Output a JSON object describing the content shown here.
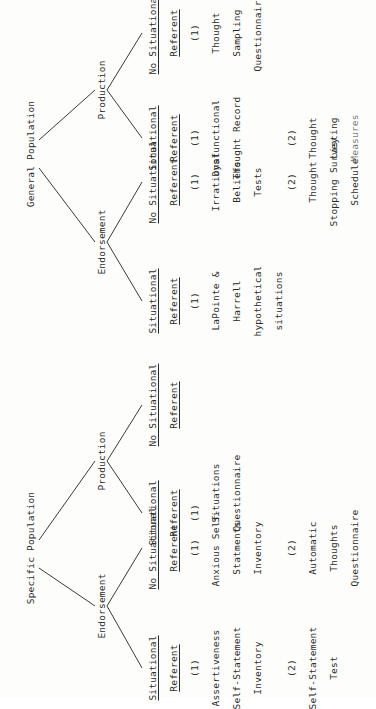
{
  "document": {
    "rotation": "page rotated 90 degrees counter-clockwise",
    "trees": [
      {
        "root": "Specific Population",
        "branches": [
          {
            "label": "Endorsement",
            "columns": [
              {
                "heading_line1": "Situational",
                "heading_line2": "Referent",
                "groups": [
                  {
                    "number": "(1)",
                    "lines": [
                      "Assertiveness",
                      "Self-Statement",
                      "Inventory"
                    ]
                  },
                  {
                    "number": "(2)",
                    "lines": [
                      "Self-Statement",
                      "Test"
                    ]
                  }
                ]
              },
              {
                "heading_line1": "No Situational",
                "heading_line2": "Referent",
                "groups": [
                  {
                    "number": "(1)",
                    "lines": [
                      "Anxious Self-",
                      "Statments",
                      "Inventory"
                    ]
                  },
                  {
                    "number": "(2)",
                    "lines": [
                      "Automatic",
                      "Thoughts",
                      "Questionnaire"
                    ]
                  }
                ]
              }
            ]
          },
          {
            "label": "Production",
            "columns": [
              {
                "heading_line1": "Situational",
                "heading_line2": "Referent",
                "groups": [
                  {
                    "number": "(1)",
                    "lines": [
                      "Situations",
                      "Questionnaire"
                    ]
                  }
                ]
              },
              {
                "heading_line1": "No Situational",
                "heading_line2": "Referent",
                "groups": []
              }
            ]
          }
        ]
      },
      {
        "root": "General Population",
        "branches": [
          {
            "label": "Endorsement",
            "columns": [
              {
                "heading_line1": "Situational",
                "heading_line2": "Referent",
                "groups": [
                  {
                    "number": "(1)",
                    "lines": [
                      "LaPointe &",
                      "Harrell",
                      "hypothetical",
                      "situations"
                    ]
                  }
                ]
              },
              {
                "heading_line1": "No Situational",
                "heading_line2": "Referent",
                "groups": [
                  {
                    "number": "(1)",
                    "lines": [
                      "Irrational",
                      "Beliefs",
                      "Tests"
                    ]
                  },
                  {
                    "number": "(2)",
                    "lines": [
                      "Thought",
                      "Stopping Survey",
                      "Schedule"
                    ]
                  }
                ]
              }
            ]
          },
          {
            "label": "Production",
            "columns": [
              {
                "heading_line1": "Situational",
                "heading_line2": "Referent",
                "groups": [
                  {
                    "number": "(1)",
                    "lines": [
                      "Dysfunctional",
                      "Thought Record"
                    ]
                  },
                  {
                    "number": "(2)",
                    "lines": [
                      "Thought",
                      "Listing",
                      "Measures"
                    ]
                  }
                ]
              },
              {
                "heading_line1": "No Situational",
                "heading_line2": "Referent",
                "groups": [
                  {
                    "number": "(1)",
                    "lines": [
                      "Thought",
                      "Sampling",
                      "Questionnaire"
                    ]
                  }
                ]
              }
            ]
          }
        ]
      }
    ]
  }
}
